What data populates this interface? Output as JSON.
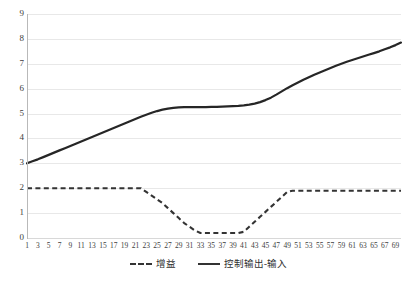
{
  "chart_data": {
    "type": "line",
    "title": "",
    "xlabel": "",
    "ylabel": "",
    "ylim": [
      0,
      9
    ],
    "yticks": [
      0,
      1,
      2,
      3,
      4,
      5,
      6,
      7,
      8,
      9
    ],
    "grid": true,
    "legend_position": "bottom",
    "x": [
      1,
      2,
      3,
      4,
      5,
      6,
      7,
      8,
      9,
      10,
      11,
      12,
      13,
      14,
      15,
      16,
      17,
      18,
      19,
      20,
      21,
      22,
      23,
      24,
      25,
      26,
      27,
      28,
      29,
      30,
      31,
      32,
      33,
      34,
      35,
      36,
      37,
      38,
      39,
      40,
      41,
      42,
      43,
      44,
      45,
      46,
      47,
      48,
      49,
      50,
      51,
      52,
      53,
      54,
      55,
      56,
      57,
      58,
      59,
      60,
      61,
      62,
      63,
      64,
      65,
      66,
      67,
      68,
      69,
      70
    ],
    "xticklabels": [
      "1",
      "3",
      "5",
      "7",
      "9",
      "11",
      "13",
      "15",
      "17",
      "19",
      "21",
      "23",
      "25",
      "27",
      "29",
      "31",
      "33",
      "35",
      "37",
      "39",
      "41",
      "43",
      "45",
      "47",
      "49",
      "51",
      "53",
      "55",
      "57",
      "59",
      "61",
      "63",
      "65",
      "67",
      "69"
    ],
    "series": [
      {
        "name": "增益",
        "style": "dashed",
        "color": "#333333",
        "values": [
          2.0,
          2.0,
          2.0,
          2.0,
          2.0,
          2.0,
          2.0,
          2.0,
          2.0,
          2.0,
          2.0,
          2.0,
          2.0,
          2.0,
          2.0,
          2.0,
          2.0,
          2.0,
          2.0,
          2.0,
          2.0,
          2.0,
          1.85,
          1.7,
          1.55,
          1.4,
          1.2,
          1.0,
          0.8,
          0.6,
          0.45,
          0.3,
          0.2,
          0.2,
          0.2,
          0.2,
          0.2,
          0.2,
          0.2,
          0.2,
          0.25,
          0.45,
          0.65,
          0.85,
          1.05,
          1.25,
          1.45,
          1.65,
          1.85,
          1.9,
          1.9,
          1.9,
          1.9,
          1.9,
          1.9,
          1.9,
          1.9,
          1.9,
          1.9,
          1.9,
          1.9,
          1.9,
          1.9,
          1.9,
          1.9,
          1.9,
          1.9,
          1.9,
          1.9,
          1.9
        ]
      },
      {
        "name": "控制输出-输入",
        "style": "solid",
        "color": "#262626",
        "values": [
          3.0,
          3.08,
          3.16,
          3.25,
          3.34,
          3.43,
          3.52,
          3.61,
          3.7,
          3.79,
          3.88,
          3.97,
          4.06,
          4.15,
          4.24,
          4.33,
          4.42,
          4.51,
          4.6,
          4.69,
          4.78,
          4.87,
          4.95,
          5.03,
          5.1,
          5.16,
          5.2,
          5.23,
          5.25,
          5.26,
          5.26,
          5.26,
          5.26,
          5.26,
          5.27,
          5.27,
          5.28,
          5.29,
          5.3,
          5.31,
          5.33,
          5.36,
          5.4,
          5.46,
          5.54,
          5.64,
          5.76,
          5.89,
          6.02,
          6.14,
          6.25,
          6.36,
          6.46,
          6.56,
          6.65,
          6.74,
          6.83,
          6.92,
          7.0,
          7.08,
          7.15,
          7.22,
          7.29,
          7.36,
          7.43,
          7.5,
          7.58,
          7.66,
          7.75,
          7.85
        ]
      }
    ]
  },
  "legend": {
    "items": [
      {
        "label": "增益",
        "style": "dashed"
      },
      {
        "label": "控制输出-输入",
        "style": "solid"
      }
    ]
  }
}
